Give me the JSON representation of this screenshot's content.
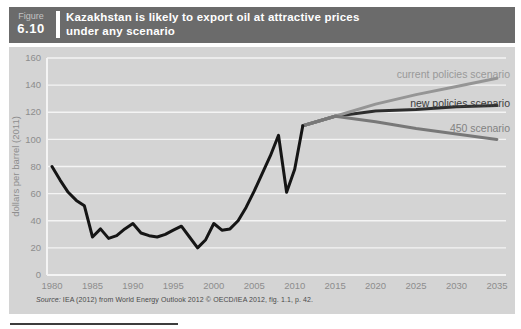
{
  "figure": {
    "label": "Figure",
    "number": "6.10",
    "title": "Kazakhstan is likely to export oil at attractive prices under any scenario"
  },
  "source": {
    "prefix": "Source:",
    "text": " IEA (2012) from World Energy Outlook 2012 © OECD/IEA 2012, fig. 1.1, p. 42."
  },
  "colors": {
    "header_bg": "#6b6b6b",
    "header_label": "#c3c3c3",
    "header_number": "#ffffff",
    "header_title": "#ffffff",
    "header_divider": "#ffffff",
    "panel_bg": "#d4d4d4",
    "gridline": "#f4f4f4",
    "axis_text": "#8d8d8d"
  },
  "chart_data": {
    "type": "line",
    "title": "Kazakhstan is likely to export oil at attractive prices under any scenario",
    "xlabel": "",
    "ylabel": "dollars per barrel (2011)",
    "ylim": [
      0,
      160
    ],
    "xlim": [
      1979,
      2037
    ],
    "yticks": [
      0,
      20,
      40,
      60,
      80,
      100,
      120,
      140,
      160
    ],
    "xticks": [
      1980,
      1985,
      1990,
      1995,
      2000,
      2005,
      2010,
      2015,
      2020,
      2025,
      2030,
      2035
    ],
    "grid": "horizontal",
    "legend_position": "inline right, labels above line ends",
    "series": [
      {
        "name": "new policies scenario",
        "color": "#2e2e2e",
        "x": [
          2011,
          2015,
          2020,
          2025,
          2030,
          2035
        ],
        "values": [
          110,
          117,
          121,
          122,
          124,
          125
        ]
      },
      {
        "name": "current policies scenario",
        "color": "#959595",
        "x": [
          2011,
          2015,
          2020,
          2025,
          2030,
          2035
        ],
        "values": [
          110,
          117,
          126,
          133,
          139,
          145
        ]
      },
      {
        "name": "450 scenario",
        "color": "#787878",
        "x": [
          2011,
          2015,
          2020,
          2025,
          2030,
          2035
        ],
        "values": [
          110,
          117,
          113,
          108,
          104,
          100
        ]
      },
      {
        "name": "historical price",
        "color": "#151515",
        "x": [
          1980,
          1981,
          1982,
          1983,
          1984,
          1985,
          1986,
          1987,
          1988,
          1989,
          1990,
          1991,
          1992,
          1993,
          1994,
          1995,
          1996,
          1997,
          1998,
          1999,
          2000,
          2001,
          2002,
          2003,
          2004,
          2005,
          2006,
          2007,
          2008,
          2009,
          2010,
          2011
        ],
        "values": [
          80,
          70,
          61,
          55,
          51,
          28,
          34,
          27,
          29,
          34,
          38,
          31,
          29,
          28,
          30,
          33,
          36,
          28,
          20,
          26,
          38,
          33,
          34,
          40,
          50,
          62,
          75,
          88,
          103,
          61,
          78,
          110
        ]
      }
    ],
    "legend": [
      {
        "label": "current policies scenario",
        "color": "#999999"
      },
      {
        "label": "new policies scenario",
        "color": "#3c3c3c"
      },
      {
        "label": "450 scenario",
        "color": "#828282"
      }
    ]
  }
}
